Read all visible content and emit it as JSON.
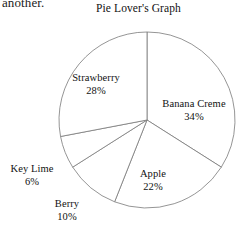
{
  "page": {
    "carryover_text": "another.",
    "background_color": "#ffffff"
  },
  "chart_data": {
    "type": "pie",
    "title": "Pie Lover's Graph",
    "xlabel": "",
    "ylabel": "",
    "legend": "none",
    "grid": false,
    "start_angle_deg": 0,
    "direction": "clockwise",
    "stroke_color": "#7a7a7a",
    "fill_color": "#ffffff",
    "center": {
      "x": 147,
      "y": 120
    },
    "radius": 88,
    "categories": [
      "Banana Creme",
      "Apple",
      "Berry",
      "Key Lime",
      "Strawberry"
    ],
    "values": [
      34,
      22,
      10,
      6,
      28
    ],
    "unit": "%",
    "total": 100,
    "slices": [
      {
        "label": "Banana Creme",
        "value": 34,
        "percent_text": "34%",
        "start_deg": 0,
        "end_deg": 122.4,
        "sweep_deg": 122.4
      },
      {
        "label": "Apple",
        "value": 22,
        "percent_text": "22%",
        "start_deg": 122.4,
        "end_deg": 201.6,
        "sweep_deg": 79.2
      },
      {
        "label": "Berry",
        "value": 10,
        "percent_text": "10%",
        "start_deg": 201.6,
        "end_deg": 237.6,
        "sweep_deg": 36
      },
      {
        "label": "Key Lime",
        "value": 6,
        "percent_text": "6%",
        "start_deg": 237.6,
        "end_deg": 259.2,
        "sweep_deg": 21.6
      },
      {
        "label": "Strawberry",
        "value": 28,
        "percent_text": "28%",
        "start_deg": 259.2,
        "end_deg": 360,
        "sweep_deg": 100.8
      }
    ]
  }
}
